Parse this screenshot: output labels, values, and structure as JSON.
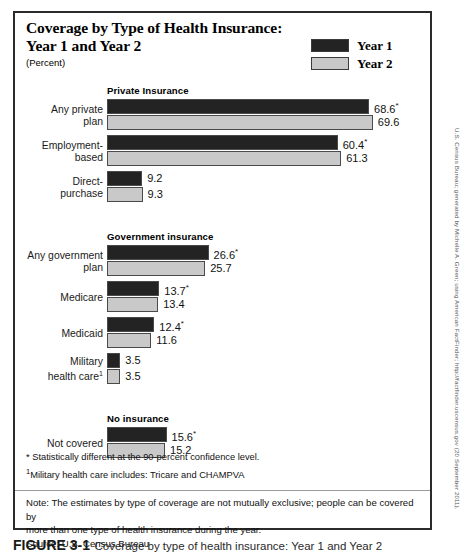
{
  "figure": {
    "title_line1": "Coverage by Type of Health Insurance:",
    "title_line2": "Year 1 and Year 2",
    "subtitle": "(Percent)"
  },
  "legend": {
    "items": [
      {
        "label": "Year 1",
        "color": "#232323",
        "name": "year-1"
      },
      {
        "label": "Year 2",
        "color": "#c8c8c8",
        "name": "year-2"
      }
    ]
  },
  "footnotes": {
    "star": "* Statistically different at the 90-percent confidence level.",
    "dagger_marker": "1",
    "dagger": "Military health care includes: Tricare and CHAMPVA"
  },
  "note": {
    "note_line1": "Note:  The estimates by type of coverage are not mutually exclusive; people can be covered by",
    "note_line2": "more than one type of health insurance during the year.",
    "source": "Source: U.S. Census Bureau"
  },
  "source_credit": "U.S. Census Bureau; generated by Michelle A. Green; using American FactFinder; http://factfinder.uscensus.gov (20 September 2011).",
  "bottom_caption": {
    "number": "FIGURE 3-1",
    "text": "Coverage by type of health insurance: Year 1 and Year 2"
  },
  "chart_data": {
    "type": "bar",
    "orientation": "horizontal",
    "title": "Coverage by Type of Health Insurance: Year 1 and Year 2",
    "xlabel": "",
    "ylabel": "",
    "unit": "percent",
    "xlim": [
      0,
      72
    ],
    "grid": false,
    "legend_position": "top-right",
    "series": [
      {
        "name": "Year 1",
        "color": "#232323"
      },
      {
        "name": "Year 2",
        "color": "#c9c9c9"
      }
    ],
    "groups": [
      {
        "header": "Private Insurance",
        "rows": [
          {
            "label_lines": [
              "Any private",
              "plan"
            ],
            "year1": {
              "value": 68.6,
              "display": "68.6",
              "significant": true
            },
            "year2": {
              "value": 69.6,
              "display": "69.6",
              "significant": false
            }
          },
          {
            "label_lines": [
              "Employment-",
              "based"
            ],
            "year1": {
              "value": 60.4,
              "display": "60.4",
              "significant": true
            },
            "year2": {
              "value": 61.3,
              "display": "61.3",
              "significant": false
            }
          },
          {
            "label_lines": [
              "Direct-",
              "purchase"
            ],
            "year1": {
              "value": 9.2,
              "display": "9.2",
              "significant": false
            },
            "year2": {
              "value": 9.3,
              "display": "9.3",
              "significant": false
            }
          }
        ]
      },
      {
        "header": "Government insurance",
        "rows": [
          {
            "label_lines": [
              "Any government",
              "plan"
            ],
            "year1": {
              "value": 26.6,
              "display": "26.6",
              "significant": true
            },
            "year2": {
              "value": 25.7,
              "display": "25.7",
              "significant": false
            }
          },
          {
            "label_lines": [
              "Medicare"
            ],
            "year1": {
              "value": 13.7,
              "display": "13.7",
              "significant": true
            },
            "year2": {
              "value": 13.4,
              "display": "13.4",
              "significant": false
            }
          },
          {
            "label_lines": [
              "Medicaid"
            ],
            "year1": {
              "value": 12.4,
              "display": "12.4",
              "significant": true
            },
            "year2": {
              "value": 11.6,
              "display": "11.6",
              "significant": false
            }
          },
          {
            "label_lines": [
              "Military",
              "health care<sup>1</sup>"
            ],
            "year1": {
              "value": 3.5,
              "display": "3.5",
              "significant": false
            },
            "year2": {
              "value": 3.5,
              "display": "3.5",
              "significant": false
            }
          }
        ]
      },
      {
        "header": "No insurance",
        "rows": [
          {
            "label_lines": [
              "Not covered"
            ],
            "year1": {
              "value": 15.6,
              "display": "15.6",
              "significant": true
            },
            "year2": {
              "value": 15.2,
              "display": "15.2",
              "significant": false
            }
          }
        ]
      }
    ]
  }
}
